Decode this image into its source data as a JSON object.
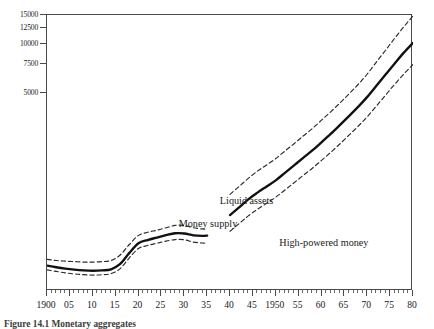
{
  "figure": {
    "caption": "Figure 14.1  Monetary aggregates"
  },
  "chart_data": {
    "type": "line",
    "title": "",
    "xlabel": "",
    "ylabel": "",
    "scale": "log",
    "grid": false,
    "legend_position": "in-plot-annotations",
    "xlim": [
      1900,
      1980
    ],
    "ylim": [
      300,
      15000
    ],
    "yticks": [
      5000,
      7500,
      10000,
      12500,
      15000
    ],
    "ytick_labels": [
      "5000",
      "7500",
      "10000",
      "12500",
      "15000"
    ],
    "xticks": [
      1900,
      1905,
      1910,
      1915,
      1920,
      1925,
      1930,
      1935,
      1940,
      1945,
      1950,
      1955,
      1960,
      1965,
      1970,
      1975,
      1980
    ],
    "xtick_labels": [
      "1900",
      "05",
      "10",
      "15",
      "20",
      "25",
      "30",
      "35",
      "40",
      "45",
      "1950",
      "55",
      "60",
      "65",
      "70",
      "75",
      "80"
    ],
    "xtick_minor_interval": 1,
    "annotations": [
      {
        "text": "Liquid assets",
        "x": 1938,
        "y": 1150
      },
      {
        "text": "Money supply",
        "x": 1929,
        "y": 830
      },
      {
        "text": "High-powered money",
        "x": 1951,
        "y": 640
      }
    ],
    "series": [
      {
        "name": "Liquid assets",
        "style": "dashed",
        "color": "#2a2a2a",
        "segments": [
          {
            "x": [
              1900,
              1902,
              1904,
              1906,
              1908,
              1910,
              1912,
              1914,
              1916,
              1918,
              1920,
              1922,
              1924,
              1926,
              1928,
              1930,
              1932,
              1934,
              1935
            ],
            "y": [
              470,
              462,
              458,
              455,
              452,
              452,
              455,
              462,
              500,
              580,
              660,
              690,
              710,
              735,
              760,
              760,
              735,
              722,
              718
            ]
          },
          {
            "x": [
              1940,
              1942,
              1944,
              1946,
              1948,
              1950,
              1952,
              1954,
              1956,
              1958,
              1960,
              1962,
              1964,
              1966,
              1968,
              1970,
              1972,
              1974,
              1976,
              1978,
              1980
            ],
            "y": [
              1180,
              1320,
              1480,
              1640,
              1790,
              1960,
              2180,
              2420,
              2700,
              3000,
              3380,
              3800,
              4300,
              4900,
              5600,
              6500,
              7700,
              9100,
              10800,
              12700,
              14800
            ]
          }
        ]
      },
      {
        "name": "Money supply",
        "style": "solid",
        "color": "#111111",
        "segments": [
          {
            "x": [
              1900,
              1902,
              1904,
              1906,
              1908,
              1910,
              1912,
              1914,
              1916,
              1918,
              1920,
              1922,
              1924,
              1926,
              1928,
              1930,
              1932,
              1934,
              1935
            ],
            "y": [
              430,
              420,
              412,
              406,
              402,
              400,
              402,
              408,
              440,
              515,
              590,
              618,
              640,
              662,
              680,
              678,
              660,
              655,
              658
            ]
          },
          {
            "x": [
              1940,
              1942,
              1944,
              1946,
              1948,
              1950,
              1952,
              1954,
              1956,
              1958,
              1960,
              1962,
              1964,
              1966,
              1968,
              1970,
              1972,
              1974,
              1976,
              1978,
              1980
            ],
            "y": [
              880,
              980,
              1100,
              1210,
              1320,
              1440,
              1600,
              1780,
              1980,
              2200,
              2470,
              2780,
              3150,
              3580,
              4080,
              4700,
              5500,
              6450,
              7550,
              8800,
              10100
            ]
          }
        ]
      },
      {
        "name": "High-powered money",
        "style": "dashed",
        "color": "#2a2a2a",
        "segments": [
          {
            "x": [
              1900,
              1902,
              1904,
              1906,
              1908,
              1910,
              1912,
              1914,
              1916,
              1918,
              1920,
              1922,
              1924,
              1926,
              1928,
              1930,
              1932,
              1934,
              1935
            ],
            "y": [
              405,
              396,
              388,
              382,
              378,
              376,
              378,
              384,
              412,
              480,
              548,
              572,
              590,
              608,
              622,
              620,
              600,
              592,
              594
            ]
          },
          {
            "x": [
              1940,
              1942,
              1944,
              1946,
              1948,
              1950,
              1952,
              1954,
              1956,
              1958,
              1960,
              1962,
              1964,
              1966,
              1968,
              1970,
              1972,
              1974,
              1976,
              1978,
              1980
            ],
            "y": [
              700,
              780,
              870,
              955,
              1040,
              1135,
              1255,
              1390,
              1545,
              1710,
              1910,
              2140,
              2410,
              2730,
              3100,
              3550,
              4130,
              4820,
              5620,
              6500,
              7450
            ]
          }
        ]
      }
    ]
  }
}
